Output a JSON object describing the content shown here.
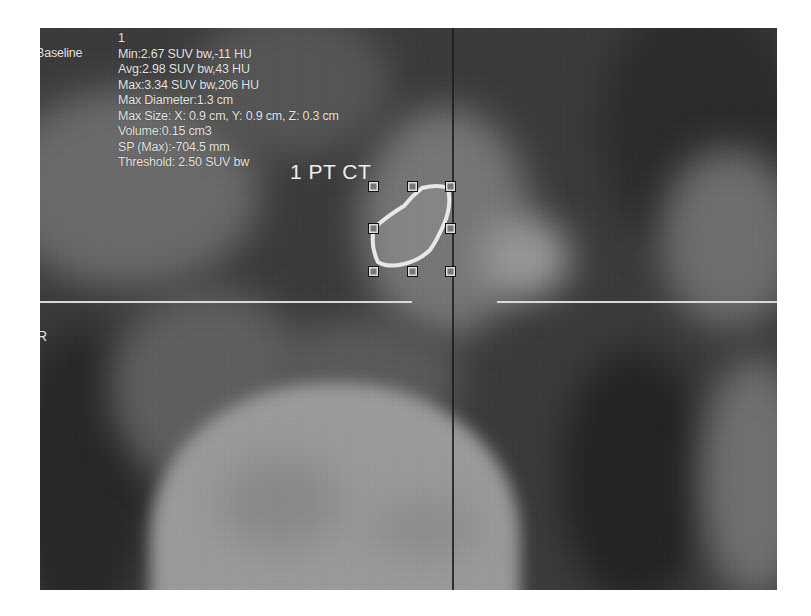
{
  "viewer": {
    "series_label": "Baseline",
    "roi_index": "1",
    "stats": {
      "min": "Min:2.67 SUV bw,-11 HU",
      "avg": "Avg:2.98 SUV bw,43 HU",
      "max": "Max:3.34 SUV bw,206 HU",
      "max_diameter": "Max Diameter:1.3 cm",
      "max_size": "Max Size: X: 0.9  cm, Y: 0.9  cm, Z: 0.3  cm",
      "volume": "Volume:0.15 cm3",
      "sp_max": "SP (Max):-704.5 mm",
      "threshold": "Threshold: 2.50 SUV bw"
    },
    "plane_label": "1 PT CT",
    "orientation_label": "R",
    "icons": {
      "roi_contour": "roi-contour-icon",
      "resize_handle": "resize-handle-icon",
      "crosshair": "crosshair-icon"
    },
    "colors": {
      "overlay_text": "#e6e6e6",
      "crosshair_horizontal": "#d8d8d8",
      "crosshair_vertical": "#1c1c1c",
      "roi_outline": "#e8e8e8",
      "background": "#3a3a3a"
    }
  }
}
